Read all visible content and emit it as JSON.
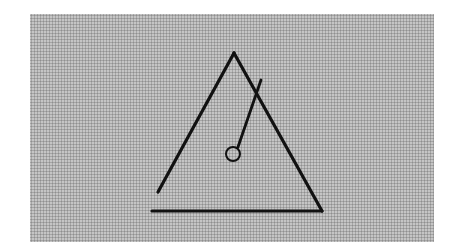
{
  "figure": {
    "background": {
      "color": "#d9d9d9",
      "pattern": "halftone-dots",
      "x": 30,
      "y": 14,
      "width": 404,
      "height": 228
    },
    "stroke_color": "#111111",
    "triangle": {
      "apex": [
        234,
        53
      ],
      "left_side_end": [
        158,
        192
      ],
      "base_start": [
        152,
        211
      ],
      "base_end": [
        322,
        211
      ]
    },
    "pendulum": {
      "rod_top": [
        261,
        80
      ],
      "rod_bottom": [
        238,
        147
      ],
      "bob_center": [
        233,
        154
      ],
      "bob_radius": 7
    }
  }
}
